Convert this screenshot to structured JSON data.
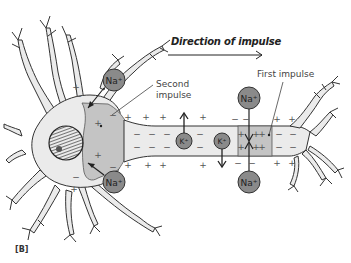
{
  "figure": {
    "panel_label": "[B]",
    "title": "Direction of impulse",
    "labels": {
      "second_impulse_line1": "Second",
      "second_impulse_line2": "impulse",
      "first_impulse": "First impulse"
    },
    "ions": {
      "sodium": "Na+",
      "potassium": "K+"
    },
    "charges": {
      "positive": "+",
      "negative": "−"
    },
    "colors": {
      "cell_fill": "#ebebeb",
      "depolarized_region": "#c4c4c4",
      "ion_fill": "#8a8a8a",
      "outline": "#333333",
      "arrow": "#222222"
    }
  }
}
